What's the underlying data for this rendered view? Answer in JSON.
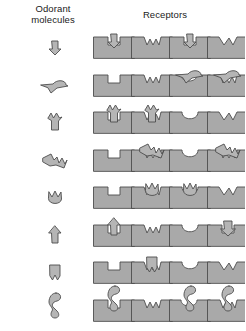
{
  "headers": {
    "odorant": "Odorant\nmolecules",
    "receptors": "Receptors"
  },
  "colors": {
    "block_fill": "#a9a9a9",
    "block_stroke": "#4d4d4d",
    "molecule_fill": "#b5b5b5",
    "molecule_stroke": "#4d4d4d",
    "background": "#ffffff",
    "text": "#1a1a1a"
  },
  "layout": {
    "width": 245,
    "height": 331,
    "rows": 8,
    "receptor_columns": 4,
    "molecule_column_x": 55,
    "receptor_column_x": [
      114,
      152,
      190,
      228
    ],
    "row_baseline_y": [
      58,
      96,
      133,
      171,
      208,
      246,
      283,
      321
    ],
    "block_width": 41,
    "block_height": 21
  },
  "chart_data": {
    "type": "diagram",
    "columns": [
      "Odorant molecules",
      "Receptor 1",
      "Receptor 2",
      "Receptor 3",
      "Receptor 4"
    ],
    "rows": [
      {
        "index": 1,
        "molecule": "down-arrow",
        "receptors": [
          {
            "notch": "square",
            "bound": true,
            "bound_shape": "down-arrow"
          },
          {
            "notch": "w-zigzag",
            "bound": false
          },
          {
            "notch": "square",
            "bound": true,
            "bound_shape": "down-arrow"
          },
          {
            "notch": "v-wedge",
            "bound": false
          }
        ]
      },
      {
        "index": 2,
        "molecule": "tadpole-wing",
        "receptors": [
          {
            "notch": "square",
            "bound": false
          },
          {
            "notch": "w-zigzag",
            "bound": false
          },
          {
            "notch": "wide-flat",
            "bound": true,
            "bound_shape": "tadpole-wing"
          },
          {
            "notch": "w-zigzag",
            "bound": true,
            "bound_shape": "tadpole-wing"
          }
        ]
      },
      {
        "index": 3,
        "molecule": "double-spike-arrow",
        "receptors": [
          {
            "notch": "square",
            "bound": true,
            "bound_shape": "double-spike-arrow"
          },
          {
            "notch": "w-zigzag",
            "bound": true,
            "bound_shape": "double-spike-arrow"
          },
          {
            "notch": "u-round",
            "bound": false
          },
          {
            "notch": "v-wedge",
            "bound": false
          }
        ]
      },
      {
        "index": 4,
        "molecule": "arrowhead-zigzag",
        "receptors": [
          {
            "notch": "square",
            "bound": false
          },
          {
            "notch": "w-zigzag",
            "bound": true,
            "bound_shape": "arrowhead-zigzag"
          },
          {
            "notch": "u-round",
            "bound": false
          },
          {
            "notch": "w-zigzag",
            "bound": true,
            "bound_shape": "arrowhead-zigzag"
          }
        ]
      },
      {
        "index": 5,
        "molecule": "flame-tulip",
        "receptors": [
          {
            "notch": "square",
            "bound": false
          },
          {
            "notch": "w-zigzag",
            "bound": true,
            "bound_shape": "flame-tulip"
          },
          {
            "notch": "u-round",
            "bound": true,
            "bound_shape": "flame-tulip"
          },
          {
            "notch": "v-wedge",
            "bound": false
          }
        ]
      },
      {
        "index": 6,
        "molecule": "up-arrow-tall",
        "receptors": [
          {
            "notch": "square",
            "bound": true,
            "bound_shape": "up-arrow-tall"
          },
          {
            "notch": "w-zigzag",
            "bound": false
          },
          {
            "notch": "u-round",
            "bound": false
          },
          {
            "notch": "square",
            "bound": true,
            "bound_shape": "down-arrow-fat"
          }
        ]
      },
      {
        "index": 7,
        "molecule": "bell-notch",
        "receptors": [
          {
            "notch": "square",
            "bound": false
          },
          {
            "notch": "w-zigzag",
            "bound": true,
            "bound_shape": "bell-notch"
          },
          {
            "notch": "u-round",
            "bound": false
          },
          {
            "notch": "v-wedge",
            "bound": false
          }
        ]
      },
      {
        "index": 8,
        "molecule": "s-curve-bone",
        "receptors": [
          {
            "notch": "square",
            "bound": true,
            "bound_shape": "s-curve-bone"
          },
          {
            "notch": "w-zigzag",
            "bound": false
          },
          {
            "notch": "wide-flat",
            "bound": true,
            "bound_shape": "s-curve-bone"
          },
          {
            "notch": "w-zigzag",
            "bound": true,
            "bound_shape": "s-curve-bone"
          }
        ]
      }
    ]
  }
}
